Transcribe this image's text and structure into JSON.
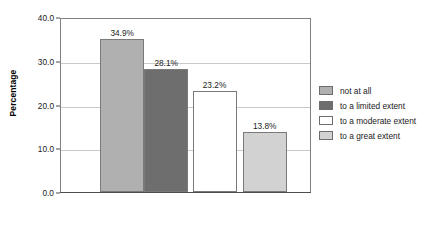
{
  "chart_data": {
    "type": "bar",
    "title": "",
    "xlabel": "",
    "ylabel": "Percentage",
    "ylim": [
      0,
      40
    ],
    "yticks": [
      "0.0",
      "10.0",
      "20.0",
      "30.0",
      "40.0"
    ],
    "ytick_values": [
      0,
      10,
      20,
      30,
      40
    ],
    "grid": "horizontal",
    "legend_position": "right",
    "categories": [
      "not at all",
      "to a limited extent",
      "to a moderate extent",
      "to a great extent"
    ],
    "values": [
      34.9,
      28.1,
      23.2,
      13.8
    ],
    "data_labels": [
      "34.9%",
      "28.1%",
      "23.2%",
      "13.8%"
    ],
    "colors": [
      "#b0b0b0",
      "#6e6e6e",
      "#ffffff",
      "#d2d2d2"
    ],
    "bar_border_color": "#7a7a7a"
  },
  "axis": {
    "y_title": "Percentage"
  },
  "legend": {
    "items": [
      {
        "label": "not at all",
        "color": "#b0b0b0"
      },
      {
        "label": "to a limited extent",
        "color": "#6e6e6e"
      },
      {
        "label": "to a moderate extent",
        "color": "#ffffff"
      },
      {
        "label": "to a great extent",
        "color": "#d2d2d2"
      }
    ]
  }
}
